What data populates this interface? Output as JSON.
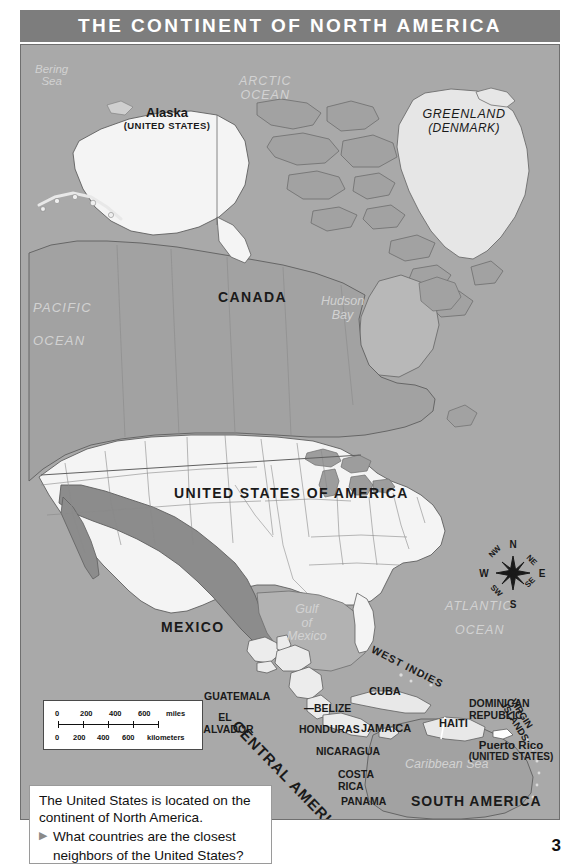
{
  "header": {
    "title": "THE CONTINENT OF NORTH AMERICA"
  },
  "map": {
    "countries": [
      {
        "name": "Alaska",
        "sub": "(UNITED STATES)"
      },
      {
        "name": "GREENLAND",
        "sub": "(DENMARK)"
      },
      {
        "name": "CANADA"
      },
      {
        "name": "UNITED STATES OF AMERICA"
      },
      {
        "name": "MEXICO"
      },
      {
        "name": "GUATEMALA"
      },
      {
        "name": "BELIZE"
      },
      {
        "name": "EL SALVADOR"
      },
      {
        "name": "HONDURAS"
      },
      {
        "name": "NICARAGUA"
      },
      {
        "name": "COSTA RICA"
      },
      {
        "name": "PANAMA"
      },
      {
        "name": "CUBA"
      },
      {
        "name": "JAMAICA"
      },
      {
        "name": "HAITI"
      },
      {
        "name": "DOMINICAN REPUBLIC"
      },
      {
        "name": "Puerto Rico",
        "sub": "(UNITED STATES)"
      }
    ],
    "labels": {
      "alaska": "Alaska",
      "alaska_sub": "(UNITED STATES)",
      "greenland": "GREENLAND",
      "greenland_sub": "(DENMARK)",
      "canada": "CANADA",
      "usa": "UNITED STATES OF AMERICA",
      "mexico": "MEXICO",
      "guatemala": "GUATEMALA",
      "belize": "BELIZE",
      "el_salvador_1": "EL",
      "el_salvador_2": "SALVADOR",
      "honduras": "HONDURAS",
      "nicaragua": "NICARAGUA",
      "costa_rica_1": "COSTA",
      "costa_rica_2": "RICA",
      "panama": "PANAMA",
      "cuba": "CUBA",
      "jamaica": "JAMAICA",
      "haiti": "HAITI",
      "dominican_1": "DOMINICAN",
      "dominican_2": "REPUBLIC",
      "puerto_rico": "Puerto Rico",
      "puerto_rico_sub": "(UNITED STATES)",
      "central_america": "CENTRAL AMERICA",
      "south_america": "SOUTH AMERICA",
      "west_indies": "WEST INDIES",
      "virgin_islands": "VIRGIN ISLANDS"
    },
    "water_labels": {
      "bering_1": "Bering",
      "bering_2": "Sea",
      "arctic_1": "ARCTIC",
      "arctic_2": "OCEAN",
      "pacific_1": "PACIFIC",
      "pacific_2": "OCEAN",
      "atlantic_1": "ATLANTIC",
      "atlantic_2": "OCEAN",
      "hudson_1": "Hudson",
      "hudson_2": "Bay",
      "gulf_1": "Gulf",
      "gulf_2": "of",
      "gulf_3": "Mexico",
      "caribbean": "Caribbean Sea"
    },
    "scale": {
      "miles_ticks": [
        "0",
        "200",
        "400",
        "600"
      ],
      "miles_unit": "miles",
      "km_ticks": [
        "0",
        "200",
        "400",
        "600"
      ],
      "km_unit": "kilometers"
    },
    "compass": {
      "n": "N",
      "ne": "NE",
      "e": "E",
      "se": "SE",
      "s": "S",
      "sw": "SW",
      "w": "W",
      "nw": "NW"
    },
    "colors": {
      "ocean": "#a9a9a9",
      "land_canada": "#a9a9a9",
      "land_usa": "#f2f2f2",
      "land_mexico": "#8e8e8e",
      "greenland": "#e4e4e4",
      "title_band": "#7d7d7d",
      "title_text": "#ffffff"
    }
  },
  "caption": {
    "line1": "The United States is located on the",
    "line2": "continent of North America.",
    "bullet": "▶",
    "question_line1": "What countries are the closest",
    "question_line2": "neighbors of the United States?"
  },
  "footer": {
    "page_number": "3"
  }
}
